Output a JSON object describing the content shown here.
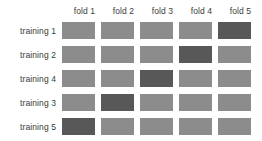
{
  "chart_data": {
    "type": "heatmap",
    "title": "",
    "xlabel": "",
    "ylabel": "",
    "legend": [],
    "grid": false,
    "categories": [
      "fold 1",
      "fold 2",
      "fold 3",
      "fold 4",
      "fold 5"
    ],
    "rows": [
      "training 1",
      "training 2",
      "training 4",
      "training 3",
      "training 5"
    ],
    "value_labels": {
      "0": "training",
      "1": "validation"
    },
    "colors": {
      "training": "#8c8c8c",
      "validation": "#585858",
      "background": "#ffffff",
      "text": "#3a3a3a"
    },
    "values": [
      [
        0,
        0,
        0,
        0,
        1
      ],
      [
        0,
        0,
        0,
        1,
        0
      ],
      [
        0,
        0,
        1,
        0,
        0
      ],
      [
        0,
        1,
        0,
        0,
        0
      ],
      [
        1,
        0,
        0,
        0,
        0
      ]
    ]
  },
  "columns": [
    {
      "label": "fold 1"
    },
    {
      "label": "fold 2"
    },
    {
      "label": "fold 3"
    },
    {
      "label": "fold 4"
    },
    {
      "label": "fold 5"
    }
  ],
  "rows": [
    {
      "label": "training 1",
      "cells": [
        {
          "state": "light"
        },
        {
          "state": "light"
        },
        {
          "state": "light"
        },
        {
          "state": "light"
        },
        {
          "state": "dark"
        }
      ]
    },
    {
      "label": "training 2",
      "cells": [
        {
          "state": "light"
        },
        {
          "state": "light"
        },
        {
          "state": "light"
        },
        {
          "state": "dark"
        },
        {
          "state": "light"
        }
      ]
    },
    {
      "label": "training 4",
      "cells": [
        {
          "state": "light"
        },
        {
          "state": "light"
        },
        {
          "state": "dark"
        },
        {
          "state": "light"
        },
        {
          "state": "light"
        }
      ]
    },
    {
      "label": "training 3",
      "cells": [
        {
          "state": "light"
        },
        {
          "state": "dark"
        },
        {
          "state": "light"
        },
        {
          "state": "light"
        },
        {
          "state": "light"
        }
      ]
    },
    {
      "label": "training 5",
      "cells": [
        {
          "state": "dark"
        },
        {
          "state": "light"
        },
        {
          "state": "light"
        },
        {
          "state": "light"
        },
        {
          "state": "light"
        }
      ]
    }
  ]
}
